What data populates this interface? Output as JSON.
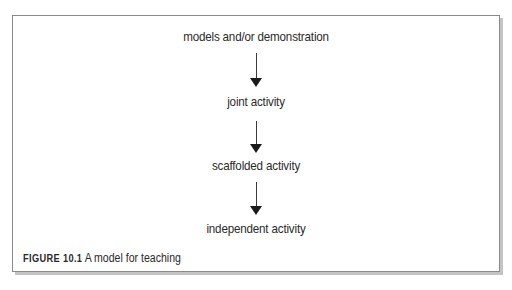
{
  "figure": {
    "steps": [
      {
        "label": "models and/or demonstration"
      },
      {
        "label": "joint activity"
      },
      {
        "label": "scaffolded activity"
      },
      {
        "label": "independent activity"
      }
    ],
    "arrows": [
      {
        "from": "models and/or demonstration",
        "to": "joint activity",
        "icon": "arrow-down-icon"
      },
      {
        "from": "joint activity",
        "to": "scaffolded activity",
        "icon": "arrow-down-icon"
      },
      {
        "from": "scaffolded activity",
        "to": "independent activity",
        "icon": "arrow-down-icon"
      }
    ],
    "caption": {
      "label": "FIGURE 10.1",
      "text": " A model for teaching"
    }
  }
}
